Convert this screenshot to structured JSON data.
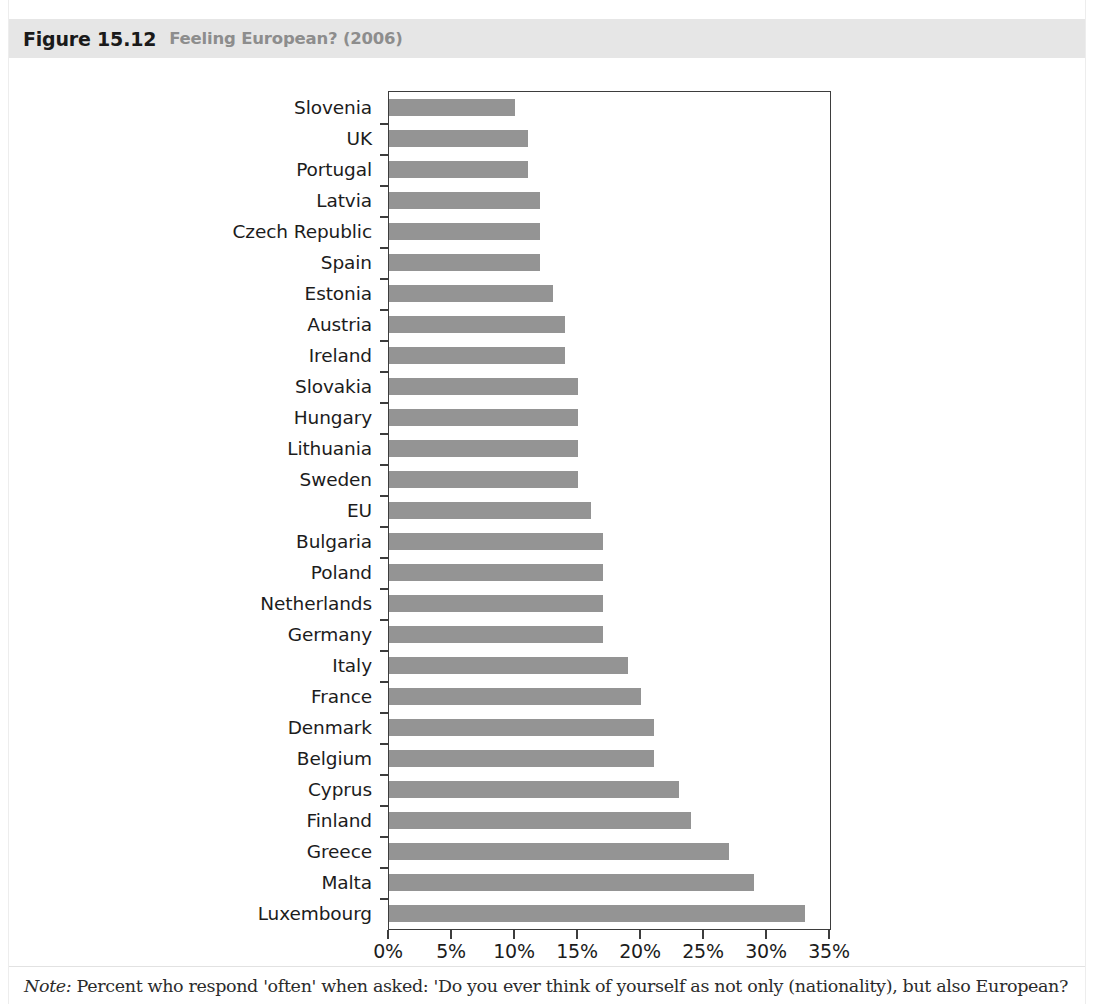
{
  "figure": {
    "number": "Figure 15.12",
    "caption": "Feeling European? (2006)",
    "band_color": "#e6e6e6",
    "caption_color": "#8d8d8d"
  },
  "note": {
    "label": "Note:",
    "text": " Percent who respond 'often' when asked: 'Do you ever think of yourself as not only (nationality), but also European?"
  },
  "chart_data": {
    "type": "bar",
    "orientation": "horizontal",
    "title": "Feeling European? (2006)",
    "xlabel": "",
    "ylabel": "",
    "xlim": [
      0,
      35
    ],
    "xticks": [
      0,
      5,
      10,
      15,
      20,
      25,
      30,
      35
    ],
    "xticklabels": [
      "0%",
      "5%",
      "10%",
      "15%",
      "20%",
      "25%",
      "30%",
      "35%"
    ],
    "grid": false,
    "legend": false,
    "bar_color": "#949494",
    "categories": [
      "Slovenia",
      "UK",
      "Portugal",
      "Latvia",
      "Czech Republic",
      "Spain",
      "Estonia",
      "Austria",
      "Ireland",
      "Slovakia",
      "Hungary",
      "Lithuania",
      "Sweden",
      "EU",
      "Bulgaria",
      "Poland",
      "Netherlands",
      "Germany",
      "Italy",
      "France",
      "Denmark",
      "Belgium",
      "Cyprus",
      "Finland",
      "Greece",
      "Malta",
      "Luxembourg"
    ],
    "values": [
      10,
      11,
      11,
      12,
      12,
      12,
      13,
      14,
      14,
      15,
      15,
      15,
      15,
      16,
      17,
      17,
      17,
      17,
      19,
      20,
      21,
      21,
      23,
      24,
      27,
      29,
      33
    ]
  }
}
